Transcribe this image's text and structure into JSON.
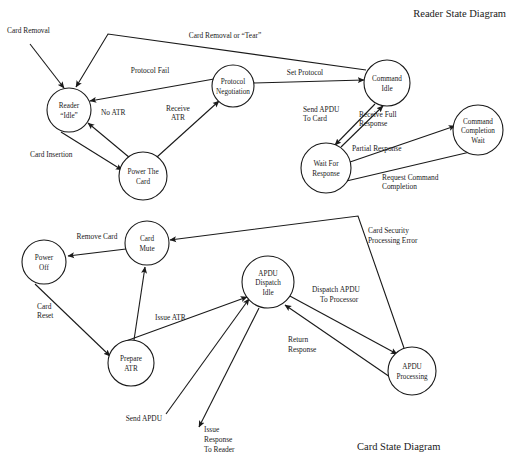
{
  "page": {
    "width": 514,
    "height": 467,
    "background": "#ffffff",
    "ink": "#1a1a1a"
  },
  "titles": {
    "reader": "Reader State Diagram",
    "card": "Card State Diagram"
  },
  "reader_diagram": {
    "title": "Reader State Diagram",
    "nodes": [
      {
        "id": "reader-idle",
        "line1": "Reader",
        "line2": "“Idle”",
        "line3": "",
        "cx": 69,
        "cy": 110,
        "r": 22
      },
      {
        "id": "power-the-card",
        "line1": "Power The",
        "line2": "Card",
        "line3": "",
        "cx": 143,
        "cy": 176,
        "r": 24
      },
      {
        "id": "protocol-negotiation",
        "line1": "Protocol",
        "line2": "Negotiation",
        "line3": "",
        "cx": 233,
        "cy": 86,
        "r": 20
      },
      {
        "id": "command-idle",
        "line1": "Command",
        "line2": "Idle",
        "line3": "",
        "cx": 387,
        "cy": 83,
        "r": 22
      },
      {
        "id": "wait-for-response",
        "line1": "Wait For",
        "line2": "Response",
        "line3": "",
        "cx": 326,
        "cy": 168,
        "r": 25
      },
      {
        "id": "command-completion-wait",
        "line1": "Command",
        "line2": "Completion",
        "line3": "Wait",
        "cx": 478,
        "cy": 130,
        "r": 25
      }
    ],
    "edges": [
      {
        "id": "card-removal-in",
        "label": "Card Removal",
        "from": "external",
        "to": "reader-idle"
      },
      {
        "id": "card-removal-or-tear",
        "label": "Card Removal or “Tear”",
        "from": "command-idle",
        "to": "reader-idle"
      },
      {
        "id": "protocol-fail",
        "label": "Protocol Fail",
        "from": "protocol-negotiation",
        "to": "reader-idle"
      },
      {
        "id": "card-insertion",
        "label": "Card Insertion",
        "from": "reader-idle",
        "to": "power-the-card"
      },
      {
        "id": "no-atr",
        "label": "No ATR",
        "from": "power-the-card",
        "to": "reader-idle"
      },
      {
        "id": "receive-atr",
        "label": "Receive\nATR",
        "from": "power-the-card",
        "to": "protocol-negotiation"
      },
      {
        "id": "set-protocol",
        "label": "Set Protocol",
        "from": "protocol-negotiation",
        "to": "command-idle"
      },
      {
        "id": "send-apdu-to-card",
        "label": "Send APDU\nTo Card",
        "from": "command-idle",
        "to": "wait-for-response"
      },
      {
        "id": "receive-full-response",
        "label": "Receive Full\nResponse",
        "from": "wait-for-response",
        "to": "command-idle"
      },
      {
        "id": "partial-response",
        "label": "Partial Response",
        "from": "wait-for-response",
        "to": "command-completion-wait"
      },
      {
        "id": "request-command-completion",
        "label": "Request Command\nCompletion",
        "from": "command-completion-wait",
        "to": "wait-for-response"
      }
    ],
    "edge_label_text": {
      "card_removal": "Card Removal",
      "card_removal_or_tear": "Card Removal or “Tear”",
      "protocol_fail": "Protocol Fail",
      "card_insertion": "Card Insertion",
      "no_atr": "No ATR",
      "receive_atr_1": "Receive",
      "receive_atr_2": "ATR",
      "set_protocol": "Set Protocol",
      "send_apdu_1": "Send APDU",
      "send_apdu_2": "To Card",
      "receive_full_1": "Receive Full",
      "receive_full_2": "Response",
      "partial_response": "Partial Response",
      "request_completion_1": "Request Command",
      "request_completion_2": "Completion"
    },
    "node_label_text": {
      "reader_idle_1": "Reader",
      "reader_idle_2": "“Idle”",
      "power_card_1": "Power The",
      "power_card_2": "Card",
      "protocol_neg_1": "Protocol",
      "protocol_neg_2": "Negotiation",
      "command_idle_1": "Command",
      "command_idle_2": "Idle",
      "wait_response_1": "Wait For",
      "wait_response_2": "Response",
      "completion_wait_1": "Command",
      "completion_wait_2": "Completion",
      "completion_wait_3": "Wait"
    }
  },
  "card_diagram": {
    "title": "Card State Diagram",
    "nodes": [
      {
        "id": "power-off",
        "line1": "Power",
        "line2": "Off",
        "line3": "",
        "cx": 44,
        "cy": 262,
        "r": 22
      },
      {
        "id": "card-mute",
        "line1": "Card",
        "line2": "Mute",
        "line3": "",
        "cx": 147,
        "cy": 243,
        "r": 22
      },
      {
        "id": "prepare-atr",
        "line1": "Prepare",
        "line2": "ATR",
        "line3": "",
        "cx": 131,
        "cy": 363,
        "r": 23
      },
      {
        "id": "apdu-dispatch-idle",
        "line1": "APDU",
        "line2": "Dispatch",
        "line3": "Idle",
        "cx": 268,
        "cy": 282,
        "r": 26
      },
      {
        "id": "apdu-processing",
        "line1": "APDU",
        "line2": "Processing",
        "line3": "",
        "cx": 412,
        "cy": 371,
        "r": 24
      }
    ],
    "edges": [
      {
        "id": "remove-card",
        "label": "Remove Card",
        "from": "card-mute",
        "to": "power-off"
      },
      {
        "id": "card-reset",
        "label": "Card\nReset",
        "from": "power-off",
        "to": "prepare-atr"
      },
      {
        "id": "issue-atr",
        "label": "Issue ATR",
        "from": "prepare-atr",
        "to": "apdu-dispatch-idle"
      },
      {
        "id": "prepare-atr-to-mute",
        "label": "",
        "from": "prepare-atr",
        "to": "card-mute"
      },
      {
        "id": "card-security-processing-error",
        "label": "Card Security\nProcessing Error",
        "from": "apdu-processing",
        "to": "card-mute"
      },
      {
        "id": "dispatch-apdu-to-processor",
        "label": "Dispatch APDU\nTo Processor",
        "from": "apdu-dispatch-idle",
        "to": "apdu-processing"
      },
      {
        "id": "return-response",
        "label": "Return\nResponse",
        "from": "apdu-processing",
        "to": "apdu-dispatch-idle"
      },
      {
        "id": "send-apdu",
        "label": "Send APDU",
        "from": "external",
        "to": "apdu-dispatch-idle"
      },
      {
        "id": "issue-response-to-reader",
        "label": "Issue\nResponse\nTo Reader",
        "from": "apdu-dispatch-idle",
        "to": "external"
      }
    ],
    "edge_label_text": {
      "remove_card": "Remove Card",
      "card_reset_1": "Card",
      "card_reset_2": "Reset",
      "issue_atr": "Issue ATR",
      "card_security_1": "Card Security",
      "card_security_2": "Processing Error",
      "dispatch_apdu_1": "Dispatch APDU",
      "dispatch_apdu_2": "To Processor",
      "return_response_1": "Return",
      "return_response_2": "Response",
      "send_apdu": "Send APDU",
      "issue_response_1": "Issue",
      "issue_response_2": "Response",
      "issue_response_3": "To Reader"
    },
    "node_label_text": {
      "power_off_1": "Power",
      "power_off_2": "Off",
      "card_mute_1": "Card",
      "card_mute_2": "Mute",
      "prepare_atr_1": "Prepare",
      "prepare_atr_2": "ATR",
      "dispatch_idle_1": "APDU",
      "dispatch_idle_2": "Dispatch",
      "dispatch_idle_3": "Idle",
      "apdu_processing_1": "APDU",
      "apdu_processing_2": "Processing"
    }
  }
}
